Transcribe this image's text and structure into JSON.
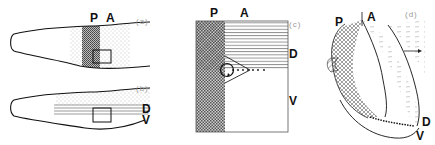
{
  "figure": {
    "panels": [
      {
        "id": "a",
        "label": "(a)",
        "axis_labels": {
          "posterior": "P",
          "anterior": "A"
        },
        "description": "Lateral outline with stippled posterior band (dark) flanked by lighter stipple, with a small rectangle box"
      },
      {
        "id": "b",
        "label": "(b)",
        "axis_labels": {
          "dorsal": "D",
          "ventral": "V"
        },
        "description": "Lateral outline with stippled dorsal half and horizontal lines at D/V boundary, with a small rectangle box"
      },
      {
        "id": "c",
        "label": "(c)",
        "axis_labels": {
          "posterior": "P",
          "anterior": "A",
          "dorsal": "D",
          "ventral": "V"
        },
        "description": "Square enlargement: crosshatched posterior column, horizontal-lined dorsal region, wedge with circle and dotted line at intersection"
      },
      {
        "id": "d",
        "label": "(d)",
        "axis_labels": {
          "posterior": "P",
          "anterior": "A",
          "dorsal": "D",
          "ventral": "V"
        },
        "description": "3D perspective sketch of outgrowth with hatched posterior surface, dashed anterior texture, beaded D/V boundary ridge and arrow"
      }
    ],
    "colors": {
      "ink": "#111111",
      "stipple_dark": "#555555",
      "stipple_light": "#9a9a9a",
      "panel_label": "#999999",
      "background": "#ffffff"
    }
  }
}
